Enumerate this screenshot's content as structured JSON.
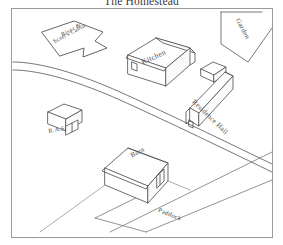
{
  "title": "The Homestead",
  "map": {
    "labels": {
      "kitchen": "Kitchen",
      "barn": "Barn",
      "residence_hall": "Residence Hall",
      "garden": "Garden",
      "paddock": "Paddock",
      "ras": "R.A.S.",
      "cabin_line1": "River &",
      "cabin_line2": "Scott's Cabin"
    },
    "colors": {
      "ink": "#4a4a4a",
      "frame": "#9a9a9a",
      "paper": "#ffffff",
      "building_fill": "#fdfdfd",
      "title_ink": "#3a3a3a"
    }
  }
}
